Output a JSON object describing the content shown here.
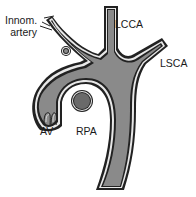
{
  "labels": {
    "innom_line1": "Innom.",
    "innom_line2": "artery",
    "lcca": "LCCA",
    "lsca": "LSCA",
    "av": "AV",
    "rpa": "RPA"
  },
  "colors": {
    "vessel_fill": "#8a8a8a",
    "vessel_wall": "#222222",
    "vessel_gap": "#e8e8e8",
    "rpa_fill": "#6a6a6a",
    "background": "#ffffff",
    "text": "#1a1a1a"
  },
  "structures": [
    {
      "id": "ascending-aorta",
      "name": "Ascending aorta"
    },
    {
      "id": "aortic-arch",
      "name": "Aortic arch"
    },
    {
      "id": "descending-aorta",
      "name": "Descending aorta"
    },
    {
      "id": "innominate-artery",
      "name": "Innom. artery"
    },
    {
      "id": "lcca",
      "name": "LCCA"
    },
    {
      "id": "lsca",
      "name": "LSCA"
    },
    {
      "id": "aortic-valve",
      "name": "AV"
    },
    {
      "id": "rpa",
      "name": "RPA"
    },
    {
      "id": "small-vessel-cross-section",
      "name": "Small vessel cross-section"
    }
  ]
}
